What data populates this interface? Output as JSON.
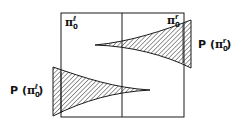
{
  "diagram": {
    "colors": {
      "stroke": "#1a1a1a",
      "hatch": "#1a1a1a",
      "background": "#ffffff"
    },
    "labels": {
      "pi_left": {
        "symbol": "π",
        "subscript": "0",
        "superscript": "ℓ"
      },
      "pi_right": {
        "symbol": "π",
        "subscript": "0",
        "superscript": "r"
      },
      "p_right": {
        "prefix": "P (",
        "symbol": "π",
        "subscript": "0",
        "superscript": "r",
        "suffix": ")"
      },
      "p_left": {
        "prefix": "P (",
        "symbol": "π",
        "subscript": "0",
        "superscript": "ℓ",
        "suffix": ")"
      }
    },
    "shapes": [
      {
        "name": "distribution-right",
        "description": "hatched tapering wedge, vertical edge at right, tapering leftward"
      },
      {
        "name": "distribution-left",
        "description": "hatched tapering wedge, vertical edge at left, tapering rightward"
      }
    ]
  }
}
